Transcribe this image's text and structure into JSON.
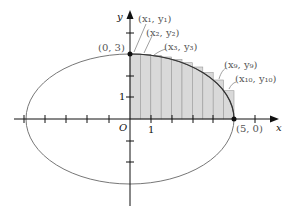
{
  "diagram": {
    "type": "ellipse-riemann-sum",
    "ellipse": {
      "a": 5,
      "b": 3,
      "equation_implied": "x^2/25 + y^2/9 = 1"
    },
    "axes": {
      "x_label": "x",
      "y_label": "y",
      "origin_label": "O",
      "y_tick_label": "1",
      "x_tick_label": "1"
    },
    "points": [
      {
        "label": "(0, 3)",
        "x": 0,
        "y": 3
      },
      {
        "label": "(5, 0)",
        "x": 5,
        "y": 0
      }
    ],
    "rectangles": {
      "count": 10,
      "width": 0.5,
      "x_left": [
        0,
        0.5,
        1,
        1.5,
        2,
        2.5,
        3,
        3.5,
        4,
        4.5
      ],
      "heights": [
        3.0,
        2.985,
        2.939,
        2.862,
        2.75,
        2.598,
        2.4,
        2.142,
        1.8,
        1.308
      ],
      "fill": "#d9d9d9"
    },
    "annotations": {
      "p1": "(x₁, y₁)",
      "p2": "(x₂, y₂)",
      "p3": "(x₃, y₃)",
      "p9": "(x₉, y₉)",
      "p10": "(x₁₀, y₁₀)"
    },
    "colors": {
      "curve": "#777777",
      "axes": "#111111",
      "labels": "#555555",
      "rect_fill": "#d9d9d9",
      "rect_stroke": "#9a9a9a"
    }
  }
}
